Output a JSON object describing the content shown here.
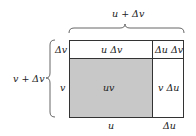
{
  "diagram": {
    "top_label": "u + Δv",
    "left_label": "v + Δv",
    "row_labels": {
      "top": "Δv",
      "bottom": "v"
    },
    "col_labels": {
      "left": "u",
      "right": "Δu"
    },
    "cells": {
      "top_left": "u Δv",
      "top_right": "Δu Δv",
      "bottom_left": "uv",
      "bottom_right": "v Δu"
    },
    "colors": {
      "shaded": "#c8c8c8",
      "line": "#333333"
    }
  }
}
